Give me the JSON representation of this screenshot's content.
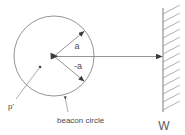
{
  "figure": {
    "labels": {
      "radius_upper": "a",
      "radius_lower": "-a",
      "point_p": "p'",
      "circle_caption": "beacon circle",
      "wall": "W"
    },
    "colors": {
      "background": "#ffffff",
      "line": "#7a7a7a",
      "hatch": "#8f8f8f",
      "text": "#4a4a4a",
      "marker": "#3a3a3a"
    },
    "geometry": {
      "circle_center_x": 54,
      "circle_center_y": 56,
      "circle_radius": 40,
      "wall_x": 163,
      "wall_top_y": 8,
      "wall_bottom_y": 112,
      "hatch_count": 13
    }
  }
}
